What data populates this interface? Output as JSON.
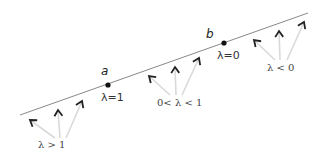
{
  "diagram": {
    "title": "",
    "line": {
      "x1": 20,
      "y1": 115,
      "x2": 308,
      "y2": 13,
      "color": "#888888"
    },
    "points": [
      {
        "id": "a",
        "label": "a",
        "lambda_label": "λ=1",
        "x": 108,
        "y": 85
      },
      {
        "id": "b",
        "label": "b",
        "lambda_label": "λ=0",
        "x": 224,
        "y": 43
      }
    ],
    "regions": [
      {
        "id": "lambda-gt-1",
        "label": "λ > 1",
        "label_pos": {
          "x": 38,
          "y": 140
        },
        "arrows": [
          {
            "tip": [
              30,
              120
            ],
            "base": [
              55,
              138
            ]
          },
          {
            "tip": [
              58,
              110
            ],
            "base": [
              60,
              138
            ]
          },
          {
            "tip": [
              82,
              101
            ],
            "base": [
              66,
              138
            ]
          }
        ]
      },
      {
        "id": "lambda-between-0-1",
        "label": "0< λ < 1",
        "label_pos": {
          "x": 157,
          "y": 98
        },
        "arrows": [
          {
            "tip": [
              149,
              76
            ],
            "base": [
              170,
              95
            ]
          },
          {
            "tip": [
              175,
              67
            ],
            "base": [
              176,
              95
            ]
          },
          {
            "tip": [
              199,
              58
            ],
            "base": [
              182,
              95
            ]
          }
        ]
      },
      {
        "id": "lambda-lt-0",
        "label": "λ < 0",
        "label_pos": {
          "x": 267,
          "y": 63
        },
        "arrows": [
          {
            "tip": [
              254,
              40
            ],
            "base": [
              275,
              60
            ]
          },
          {
            "tip": [
              279,
              31
            ],
            "base": [
              280,
              60
            ]
          },
          {
            "tip": [
              304,
              22
            ],
            "base": [
              287,
              60
            ]
          }
        ]
      }
    ],
    "colors": {
      "line": "#888888",
      "arrow_shaft": "#d9d9d9",
      "arrow_head": "#222222",
      "point": "#111111"
    }
  }
}
